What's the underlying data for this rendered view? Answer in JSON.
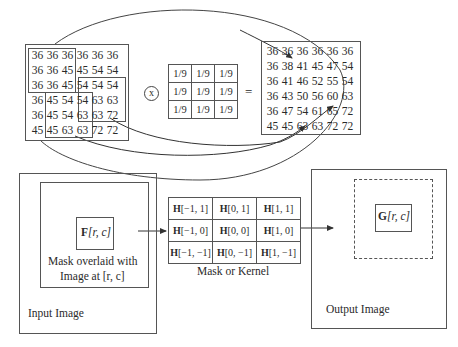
{
  "top": {
    "input_matrix": [
      [
        "36",
        "36",
        "36",
        "36",
        "36",
        "36"
      ],
      [
        "36",
        "36",
        "45",
        "45",
        "54",
        "54"
      ],
      [
        "36",
        "36",
        "45",
        "54",
        "54",
        "54"
      ],
      [
        "36",
        "45",
        "54",
        "54",
        "63",
        "63"
      ],
      [
        "36",
        "45",
        "54",
        "63",
        "63",
        "72"
      ],
      [
        "45",
        "45",
        "63",
        "63",
        "72",
        "72"
      ]
    ],
    "operator": "x",
    "kernel": [
      [
        "1/9",
        "1/9",
        "1/9"
      ],
      [
        "1/9",
        "1/9",
        "1/9"
      ],
      [
        "1/9",
        "1/9",
        "1/9"
      ]
    ],
    "equals": "=",
    "output_matrix": [
      [
        "36",
        "36",
        "36",
        "36",
        "36",
        "36"
      ],
      [
        "36",
        "38",
        "41",
        "45",
        "47",
        "54"
      ],
      [
        "36",
        "41",
        "46",
        "52",
        "55",
        "54"
      ],
      [
        "36",
        "43",
        "50",
        "56",
        "60",
        "63"
      ],
      [
        "36",
        "47",
        "54",
        "61",
        "65",
        "72"
      ],
      [
        "45",
        "45",
        "63",
        "63",
        "72",
        "72"
      ]
    ]
  },
  "bottom": {
    "input_image_label": "Input Image",
    "f_label_bold": "F",
    "f_label_rest": "[r, c]",
    "mask_caption_line1": "Mask overlaid with",
    "mask_caption_line2": "Image at [r, c]",
    "kernel_cells": [
      [
        "[−1, 1]",
        "[0, 1]",
        "[1, 1]"
      ],
      [
        "[−1, 0]",
        "[0, 0]",
        "[1, 0]"
      ],
      [
        "[−1, −1]",
        "[0, −1]",
        "[1, −1]"
      ]
    ],
    "kernel_prefix": "H",
    "kernel_caption": "Mask or Kernel",
    "g_label_bold": "G",
    "g_label_rest": "[r, c]",
    "output_image_label": "Output Image"
  }
}
